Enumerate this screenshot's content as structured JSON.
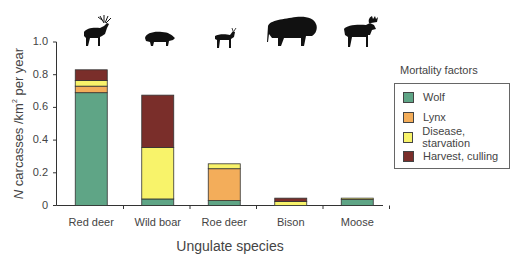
{
  "chart_data": {
    "type": "bar",
    "stacked": true,
    "title": "",
    "xlabel": "Ungulate species",
    "ylabel_prefix": "N",
    "ylabel_main": " carcasses /km",
    "ylabel_sup": "2",
    "ylabel_suffix": " per year",
    "ylim": [
      0,
      1.0
    ],
    "yticks": [
      "0",
      "0.2",
      "0.4",
      "0.6",
      "0.8",
      "1.0"
    ],
    "categories": [
      "Red deer",
      "Wild boar",
      "Roe deer",
      "Bison",
      "Moose"
    ],
    "series": [
      {
        "name": "Wolf",
        "color": "#5fa586",
        "values": [
          0.69,
          0.04,
          0.03,
          0.0,
          0.037
        ]
      },
      {
        "name": "Lynx",
        "color": "#f3ad5a",
        "values": [
          0.04,
          0.0,
          0.195,
          0.0,
          0.0
        ]
      },
      {
        "name": "Disease, starvation",
        "color": "#f8f36a",
        "values": [
          0.035,
          0.315,
          0.03,
          0.025,
          0.008
        ]
      },
      {
        "name": "Harvest, culling",
        "color": "#7a2e2a",
        "values": [
          0.065,
          0.32,
          0.0,
          0.02,
          0.0
        ]
      }
    ],
    "totals": [
      0.83,
      0.675,
      0.255,
      0.045,
      0.045
    ],
    "grid": false,
    "legend_title": "Mortality factors",
    "legend_position": "right",
    "species_icons": [
      "red-deer-silhouette",
      "wild-boar-silhouette",
      "roe-deer-silhouette",
      "bison-silhouette",
      "moose-silhouette"
    ]
  },
  "legend": {
    "title": "Mortality factors",
    "items": [
      {
        "label": "Wolf",
        "color": "#5fa586"
      },
      {
        "label": "Lynx",
        "color": "#f3ad5a"
      },
      {
        "label": "Disease, starvation",
        "color": "#f8f36a"
      },
      {
        "label": "Harvest, culling",
        "color": "#7a2e2a"
      }
    ]
  }
}
